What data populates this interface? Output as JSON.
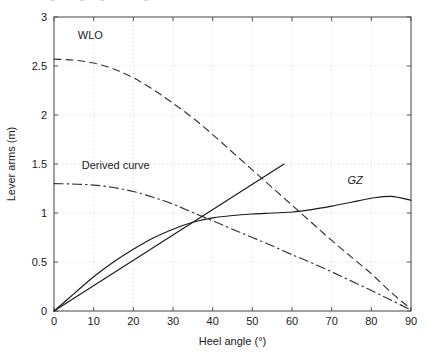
{
  "caption": {
    "text": "Figure: righting lever diagram"
  },
  "chart_data": {
    "type": "line",
    "title": "",
    "xlabel": "Heel angle (°)",
    "ylabel": "Lever arms (m)",
    "xlim": [
      0,
      90
    ],
    "ylim": [
      0,
      3
    ],
    "xticks": [
      0,
      10,
      20,
      30,
      40,
      50,
      60,
      70,
      80,
      90
    ],
    "yticks": [
      0,
      0.5,
      1,
      1.5,
      2,
      2.5,
      3
    ],
    "xticklabels": [
      "0",
      "10",
      "20",
      "30",
      "40",
      "50",
      "60",
      "70",
      "80",
      "90"
    ],
    "yticklabels": [
      "0",
      "0.5",
      "1",
      "1.5",
      "2",
      "2.5",
      "3"
    ],
    "grid": true,
    "grid_style": "dotted",
    "grid_color": "#cccccc",
    "axes_color": "#555555",
    "background": "#ffffff",
    "legend_position": "inline-annotations",
    "series": [
      {
        "name": "WLO",
        "label": "WLO",
        "style": "dashed",
        "color": "#333333",
        "label_x": 6,
        "label_y": 2.78,
        "x": [
          0,
          5,
          10,
          15,
          20,
          25,
          30,
          35,
          40,
          45,
          50,
          55,
          60,
          65,
          70,
          75,
          80,
          85,
          90
        ],
        "y": [
          2.57,
          2.56,
          2.53,
          2.47,
          2.38,
          2.26,
          2.12,
          1.97,
          1.8,
          1.62,
          1.44,
          1.26,
          1.08,
          0.9,
          0.72,
          0.55,
          0.38,
          0.19,
          0.02
        ]
      },
      {
        "name": "Derived curve",
        "label": "Derived curve",
        "style": "dashdot",
        "color": "#333333",
        "label_x": 7,
        "label_y": 1.45,
        "x": [
          0,
          5,
          10,
          15,
          20,
          25,
          30,
          35,
          40,
          45,
          50,
          55,
          60,
          65,
          70,
          75,
          80,
          85,
          90
        ],
        "y": [
          1.3,
          1.295,
          1.285,
          1.26,
          1.22,
          1.16,
          1.09,
          1.005,
          0.92,
          0.835,
          0.75,
          0.665,
          0.575,
          0.49,
          0.4,
          0.305,
          0.21,
          0.11,
          0.01
        ]
      },
      {
        "name": "GZ",
        "label": "GZ",
        "style": "solid",
        "color": "#1a1a1a",
        "label_x": 74,
        "label_y": 1.3,
        "x": [
          0,
          5,
          10,
          15,
          20,
          25,
          30,
          35,
          40,
          45,
          50,
          55,
          60,
          65,
          70,
          75,
          80,
          85,
          90
        ],
        "y": [
          0.0,
          0.175,
          0.35,
          0.5,
          0.63,
          0.745,
          0.835,
          0.905,
          0.95,
          0.975,
          0.99,
          1.0,
          1.01,
          1.035,
          1.07,
          1.11,
          1.15,
          1.17,
          1.13
        ]
      },
      {
        "name": "Initial metacentric tangent",
        "label": "",
        "style": "solid",
        "color": "#1a1a1a",
        "label_x": null,
        "label_y": null,
        "x": [
          0,
          58
        ],
        "y": [
          0.0,
          1.5
        ]
      }
    ],
    "annotations": [
      {
        "text": "WLO",
        "x": 6,
        "y": 2.78,
        "italic": false
      },
      {
        "text": "Derived curve",
        "x": 7,
        "y": 1.45,
        "italic": false
      },
      {
        "text": "GZ",
        "x": 74,
        "y": 1.3,
        "italic": true
      }
    ]
  }
}
